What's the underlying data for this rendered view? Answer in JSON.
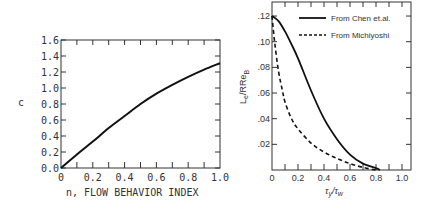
{
  "chart_data": [
    {
      "type": "line",
      "title": "",
      "xlabel": "n, FLOW BEHAVIOR INDEX",
      "ylabel": "c",
      "xlim": [
        0,
        1.0
      ],
      "ylim": [
        0,
        1.6
      ],
      "xticks": [
        "0",
        "0.2",
        "0.4",
        "0.6",
        "0.8",
        "1.0"
      ],
      "yticks": [
        "0.0",
        "0.2",
        "0.4",
        "0.6",
        "0.8",
        "1.0",
        "1.2",
        "1.4",
        "1.6"
      ],
      "grid": false,
      "series": [
        {
          "name": "c",
          "style": "solid",
          "x": [
            0,
            0.1,
            0.2,
            0.3,
            0.4,
            0.5,
            0.6,
            0.7,
            0.8,
            0.9,
            1.0
          ],
          "y": [
            0,
            0.17,
            0.33,
            0.5,
            0.65,
            0.8,
            0.93,
            1.04,
            1.14,
            1.23,
            1.31
          ]
        }
      ]
    },
    {
      "type": "line",
      "title": "",
      "xlabel": "τy/τw",
      "ylabel": "Le/RReB",
      "xlim": [
        0,
        1.07
      ],
      "ylim": [
        0,
        0.13
      ],
      "xticks": [
        "0",
        "0.2",
        "0.4",
        "0.6",
        "0.8",
        "1.0"
      ],
      "yticks": [
        ".02",
        ".04",
        ".06",
        ".08",
        ".10",
        ".12"
      ],
      "grid": false,
      "legend_position": "upper right",
      "series": [
        {
          "name": "From Chen et.al.",
          "style": "solid",
          "x": [
            0,
            0.05,
            0.1,
            0.15,
            0.2,
            0.3,
            0.4,
            0.5,
            0.6,
            0.7,
            0.8,
            0.83
          ],
          "y": [
            0.12,
            0.116,
            0.108,
            0.098,
            0.087,
            0.062,
            0.04,
            0.024,
            0.012,
            0.005,
            0.0015,
            0
          ]
        },
        {
          "name": "From Michiyoshi",
          "style": "dashed",
          "x": [
            0,
            0.02,
            0.05,
            0.08,
            0.1,
            0.15,
            0.2,
            0.3,
            0.4,
            0.5,
            0.6,
            0.7,
            0.8
          ],
          "y": [
            0.12,
            0.1,
            0.077,
            0.062,
            0.053,
            0.04,
            0.032,
            0.021,
            0.014,
            0.009,
            0.005,
            0.002,
            0
          ]
        }
      ]
    }
  ],
  "left": {
    "ylabel": "c",
    "xlabel": "n, FLOW BEHAVIOR INDEX"
  },
  "right": {
    "ylabel_main": "L",
    "ylabel_sub1": "e",
    "ylabel_mid": "/RRe",
    "ylabel_sub2": "B",
    "xlabel_main": "τ",
    "xlabel_sub1": "y",
    "xlabel_slash": "/τ",
    "xlabel_sub2": "w",
    "legend": [
      {
        "label": "From Chen et.al.",
        "style": "solid"
      },
      {
        "label": "From Michiyoshi",
        "style": "dashed"
      }
    ]
  }
}
